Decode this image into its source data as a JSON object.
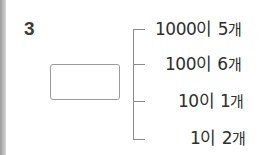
{
  "problem": {
    "number": "3",
    "answer_box_value": ""
  },
  "decomposition": [
    {
      "value": "1000",
      "particle": "이",
      "count": "5",
      "unit": "개"
    },
    {
      "value": "100",
      "particle": "이",
      "count": "6",
      "unit": "개"
    },
    {
      "value": "10",
      "particle": "이",
      "count": "1",
      "unit": "개"
    },
    {
      "value": "1",
      "particle": "이",
      "count": "2",
      "unit": "개"
    }
  ]
}
